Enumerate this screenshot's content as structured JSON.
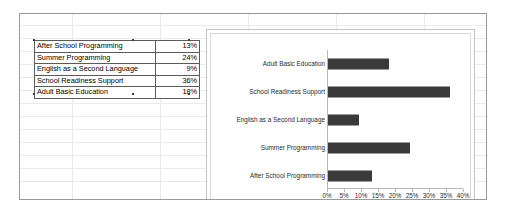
{
  "chart_data": {
    "type": "bar",
    "orientation": "horizontal",
    "title": "",
    "xlabel": "",
    "ylabel": "",
    "xlim": [
      0,
      40
    ],
    "xticks": [
      "0%",
      "5%",
      "10%",
      "15%",
      "20%",
      "25%",
      "30%",
      "35%",
      "40%"
    ],
    "xtick_values": [
      0,
      5,
      10,
      15,
      20,
      25,
      30,
      35,
      40
    ],
    "grid": false,
    "legend": false,
    "bar_color": "#3a3a3a",
    "categories": [
      "Adult Basic Education",
      "School Readiness Support",
      "English as a Second Language",
      "Summer Programming",
      "After School Programming"
    ],
    "values": [
      18,
      36,
      9,
      24,
      13
    ]
  },
  "table": {
    "rows": [
      {
        "label": "After School Programming",
        "value": "13%"
      },
      {
        "label": "Summer Programming",
        "value": "24%"
      },
      {
        "label": "English as a Second Language",
        "value": "9%"
      },
      {
        "label": "School Readiness Support",
        "value": "36%"
      },
      {
        "label": "Adult Basic Education",
        "value": "18%"
      }
    ]
  }
}
